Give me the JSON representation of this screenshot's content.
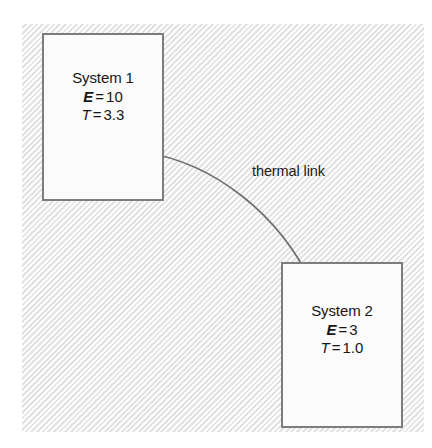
{
  "figure": {
    "background_color": "#f3f3f3",
    "box_border_color": "#7d7d7d",
    "box_fill_color": "#fbfbfb",
    "link_color": "#6e6e6e"
  },
  "systems": [
    {
      "id": "system-1",
      "title": "System 1",
      "energy_symbol": "E",
      "energy_equals": "=",
      "energy_value": "10",
      "temperature_symbol": "T",
      "temperature_equals": "=",
      "temperature_value": "3.3"
    },
    {
      "id": "system-2",
      "title": "System 2",
      "energy_symbol": "E",
      "energy_equals": "=",
      "energy_value": "3",
      "temperature_symbol": "T",
      "temperature_equals": "=",
      "temperature_value": "1.0"
    }
  ],
  "connector": {
    "label": "thermal link",
    "path": "M 143 152 C 215 163, 280 215, 313 286"
  }
}
